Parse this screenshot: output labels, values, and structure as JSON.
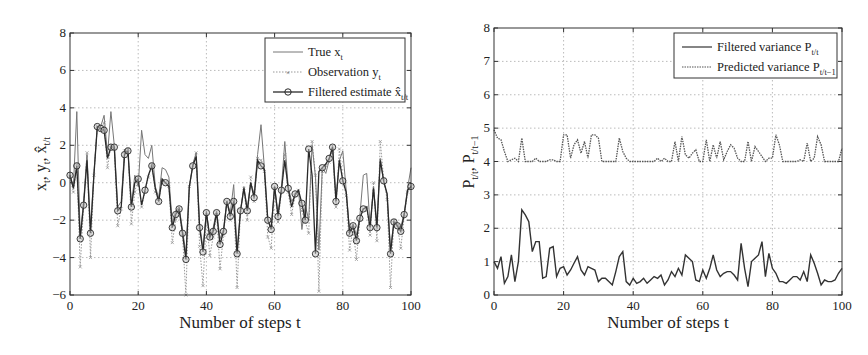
{
  "chart_data": [
    {
      "type": "line",
      "title": "",
      "xlabel": "Number of steps t",
      "ylabel": "x_t, y_t, x̂_t/t",
      "xlim": [
        0,
        100
      ],
      "ylim": [
        -6,
        8
      ],
      "xticks": [
        0,
        20,
        40,
        60,
        80,
        100
      ],
      "yticks": [
        -6,
        -4,
        -2,
        0,
        2,
        4,
        6,
        8
      ],
      "grid": true,
      "legend_position": "upper right",
      "x": [
        0,
        1,
        2,
        3,
        4,
        5,
        6,
        7,
        8,
        9,
        10,
        11,
        12,
        13,
        14,
        15,
        16,
        17,
        18,
        19,
        20,
        21,
        22,
        23,
        24,
        25,
        26,
        27,
        28,
        29,
        30,
        31,
        32,
        33,
        34,
        35,
        36,
        37,
        38,
        39,
        40,
        41,
        42,
        43,
        44,
        45,
        46,
        47,
        48,
        49,
        50,
        51,
        52,
        53,
        54,
        55,
        56,
        57,
        58,
        59,
        60,
        61,
        62,
        63,
        64,
        65,
        66,
        67,
        68,
        69,
        70,
        71,
        72,
        73,
        74,
        75,
        76,
        77,
        78,
        79,
        80,
        81,
        82,
        83,
        84,
        85,
        86,
        87,
        88,
        89,
        90,
        91,
        92,
        93,
        94,
        95,
        96,
        97,
        98,
        99,
        100
      ],
      "series": [
        {
          "name": "True x_t",
          "style": "solid thin gray",
          "values": [
            0.4,
            -0.2,
            3.8,
            -2.8,
            -1.0,
            1.5,
            -2.5,
            0.5,
            3.0,
            3.0,
            3.6,
            1.5,
            3.8,
            2.0,
            -1.3,
            -1.0,
            1.8,
            1.6,
            -1.2,
            0.4,
            -0.2,
            2.8,
            1.5,
            1.3,
            2.0,
            -0.2,
            -0.8,
            0.8,
            0.7,
            0.3,
            -2.2,
            -1.5,
            -1.3,
            -2.5,
            -3.8,
            -0.3,
            1.0,
            1.6,
            -2.2,
            -3.5,
            -1.5,
            -3.0,
            -2.4,
            -1.5,
            -3.0,
            -2.5,
            -1.0,
            -1.6,
            -0.1,
            -3.6,
            -1.5,
            -0.2,
            -1.4,
            0.0,
            -0.6,
            1.5,
            3.1,
            0.8,
            -1.9,
            -2.4,
            -0.2,
            -1.6,
            -0.3,
            2.2,
            -0.2,
            -1.0,
            -0.7,
            -0.4,
            -2.5,
            -1.2,
            -2.0,
            2.0,
            0.3,
            -3.6,
            0.8,
            0.5,
            1.2,
            2.0,
            -0.8,
            1.2,
            1.7,
            -0.4,
            -2.6,
            -2.2,
            -2.8,
            -1.8,
            0.4,
            0.5,
            -2.3,
            -0.2,
            -2.2,
            1.3,
            0.0,
            -0.6,
            -3.5,
            -2.1,
            -2.2,
            -2.4,
            -1.6,
            -0.3,
            0.8
          ]
        },
        {
          "name": "Observation y_t",
          "style": "dotted gray with x markers",
          "values": [
            0.3,
            -0.5,
            1.0,
            -4.5,
            -1.2,
            1.6,
            -4.0,
            0.4,
            3.0,
            2.8,
            3.2,
            0.8,
            2.0,
            1.8,
            -2.3,
            -1.4,
            1.7,
            1.8,
            -2.2,
            -0.5,
            0.3,
            -1.3,
            -0.5,
            0.3,
            1.0,
            -0.5,
            -1.0,
            0.1,
            0.0,
            -0.2,
            -3.2,
            -2.0,
            -1.5,
            -2.8,
            -6.0,
            -0.2,
            0.9,
            1.6,
            -3.4,
            -5.5,
            -1.8,
            -3.9,
            -2.9,
            -1.7,
            -4.6,
            -2.8,
            -1.0,
            -2.0,
            -0.9,
            -5.6,
            -1.5,
            -0.3,
            -2.0,
            0.3,
            -1.0,
            1.3,
            1.2,
            0.6,
            -2.9,
            -3.5,
            -0.3,
            -2.1,
            -0.5,
            1.5,
            -0.5,
            -1.7,
            -0.7,
            -0.4,
            -1.5,
            -2.1,
            -2.7,
            2.2,
            0.4,
            -5.8,
            0.6,
            0.9,
            1.1,
            1.7,
            -1.3,
            1.8,
            0.1,
            -0.7,
            -3.6,
            -2.4,
            -4.1,
            -2.0,
            -1.4,
            -1.3,
            -2.8,
            0.0,
            -3.1,
            2.2,
            0.2,
            -0.9,
            -5.6,
            -2.0,
            -2.3,
            -3.5,
            -1.8,
            -0.5,
            -0.2
          ]
        },
        {
          "name": "Filtered estimate x̂_t/t",
          "style": "solid dark with circle markers",
          "values": [
            0.4,
            -0.3,
            0.9,
            -3.0,
            -1.2,
            1.2,
            -2.7,
            0.4,
            3.0,
            2.9,
            2.8,
            1.3,
            1.9,
            1.9,
            -1.5,
            -1.3,
            1.5,
            1.7,
            -1.3,
            0.0,
            0.2,
            -1.2,
            -0.4,
            0.4,
            0.9,
            -0.3,
            -1.0,
            0.2,
            0.0,
            -0.2,
            -2.4,
            -1.7,
            -1.4,
            -2.7,
            -4.1,
            -0.2,
            0.9,
            1.4,
            -2.4,
            -3.7,
            -1.6,
            -2.9,
            -2.6,
            -1.6,
            -3.3,
            -2.6,
            -1.0,
            -1.8,
            -1.0,
            -3.8,
            -1.5,
            -0.3,
            -1.5,
            0.0,
            -0.8,
            1.2,
            0.9,
            0.7,
            -2.0,
            -2.5,
            -0.2,
            -1.8,
            -0.4,
            1.2,
            -0.3,
            -1.3,
            -0.6,
            -0.4,
            -1.1,
            -2.0,
            1.8,
            0.4,
            -3.8,
            0.6,
            0.8,
            1.0,
            1.3,
            1.9,
            -1.0,
            1.2,
            0.1,
            -0.5,
            -2.7,
            -2.3,
            -3.1,
            -1.9,
            -1.4,
            -1.3,
            -2.4,
            -0.3,
            -2.4,
            1.2,
            0.1,
            -0.6,
            -3.8,
            -2.1,
            -2.3,
            -2.6,
            -1.7,
            -0.4,
            -0.2
          ]
        }
      ]
    },
    {
      "type": "line",
      "title": "",
      "xlabel": "Number of steps t",
      "ylabel": "P_t/t, P_t/t−1",
      "xlim": [
        0,
        100
      ],
      "ylim": [
        0,
        8
      ],
      "xticks": [
        0,
        20,
        40,
        60,
        80,
        100
      ],
      "yticks": [
        0,
        1,
        2,
        3,
        4,
        5,
        6,
        7,
        8
      ],
      "grid": true,
      "legend_position": "upper right",
      "x": [
        0,
        1,
        2,
        3,
        4,
        5,
        6,
        7,
        8,
        9,
        10,
        11,
        12,
        13,
        14,
        15,
        16,
        17,
        18,
        19,
        20,
        21,
        22,
        23,
        24,
        25,
        26,
        27,
        28,
        29,
        30,
        31,
        32,
        33,
        34,
        35,
        36,
        37,
        38,
        39,
        40,
        41,
        42,
        43,
        44,
        45,
        46,
        47,
        48,
        49,
        50,
        51,
        52,
        53,
        54,
        55,
        56,
        57,
        58,
        59,
        60,
        61,
        62,
        63,
        64,
        65,
        66,
        67,
        68,
        69,
        70,
        71,
        72,
        73,
        74,
        75,
        76,
        77,
        78,
        79,
        80,
        81,
        82,
        83,
        84,
        85,
        86,
        87,
        88,
        89,
        90,
        91,
        92,
        93,
        94,
        95,
        96,
        97,
        98,
        99,
        100
      ],
      "series": [
        {
          "name": "Filtered variance P_t/t",
          "style": "solid dark",
          "values": [
            1.0,
            0.8,
            1.15,
            0.35,
            0.55,
            1.2,
            0.4,
            1.0,
            2.55,
            2.4,
            2.2,
            1.3,
            1.6,
            1.6,
            0.5,
            0.55,
            1.4,
            1.45,
            0.55,
            0.8,
            0.85,
            0.6,
            0.75,
            0.95,
            1.15,
            0.75,
            0.6,
            0.85,
            0.8,
            0.75,
            0.4,
            0.5,
            0.5,
            0.4,
            0.3,
            0.7,
            1.15,
            1.3,
            0.4,
            0.3,
            0.5,
            0.35,
            0.4,
            0.5,
            0.35,
            0.45,
            0.55,
            0.5,
            0.6,
            0.3,
            0.45,
            0.7,
            0.55,
            0.8,
            0.6,
            1.2,
            1.1,
            1.0,
            0.45,
            0.4,
            0.75,
            0.5,
            0.8,
            1.2,
            0.75,
            0.55,
            0.65,
            0.7,
            0.7,
            0.6,
            0.45,
            1.55,
            0.8,
            0.25,
            1.0,
            1.1,
            1.2,
            1.6,
            0.55,
            1.25,
            0.8,
            0.65,
            0.4,
            0.4,
            0.35,
            0.45,
            0.55,
            0.55,
            0.45,
            0.7,
            0.4,
            1.2,
            0.95,
            0.65,
            0.3,
            0.45,
            0.4,
            0.4,
            0.45,
            0.65,
            0.8
          ]
        },
        {
          "name": "Predicted variance P_t/t−1",
          "style": "dotted gray",
          "values": [
            4.95,
            4.7,
            4.65,
            4.3,
            4.0,
            4.05,
            4.1,
            4.0,
            4.7,
            4.0,
            4.0,
            4.0,
            4.1,
            4.0,
            4.0,
            4.0,
            4.05,
            4.05,
            4.0,
            4.0,
            4.8,
            4.8,
            4.1,
            4.5,
            4.65,
            4.25,
            4.6,
            4.1,
            4.8,
            4.8,
            4.7,
            4.0,
            4.0,
            4.0,
            4.0,
            4.0,
            4.7,
            4.3,
            4.1,
            4.0,
            4.0,
            4.0,
            4.0,
            4.0,
            4.0,
            4.0,
            4.0,
            4.1,
            4.0,
            4.1,
            4.0,
            4.0,
            4.6,
            4.0,
            4.75,
            4.2,
            4.1,
            4.25,
            4.35,
            4.0,
            4.0,
            4.65,
            4.0,
            4.5,
            4.1,
            4.6,
            4.05,
            4.3,
            4.5,
            4.4,
            4.1,
            4.0,
            4.0,
            4.6,
            4.0,
            4.45,
            4.3,
            4.15,
            4.0,
            4.1,
            4.1,
            4.8,
            4.5,
            4.0,
            4.0,
            4.0,
            4.0,
            4.0,
            4.05,
            4.0,
            4.55,
            4.0,
            4.1,
            4.75,
            4.5,
            4.0,
            4.0,
            4.0,
            4.0,
            4.0,
            4.4
          ]
        }
      ]
    }
  ],
  "figures": {
    "left": {
      "ylabel_parts": [
        "x",
        "t",
        ", y",
        "t",
        ", x̂",
        "t/t"
      ],
      "xlabel": "Number of steps t",
      "legend": [
        {
          "main": "True x",
          "sub": "t"
        },
        {
          "main": "Observation y",
          "sub": "t"
        },
        {
          "main": "Filtered estimate x̂",
          "sub": "t/t"
        }
      ]
    },
    "right": {
      "xlabel": "Number of steps t",
      "legend": [
        {
          "main": "Filtered variance P",
          "sub": "t/t"
        },
        {
          "main": "Predicted variance P",
          "sub": "t/t−1"
        }
      ]
    }
  },
  "colors": {
    "axis": "#333333",
    "grid": "#bbbbbb",
    "true_line": "#777777",
    "obs_line": "#999999",
    "est_line": "#2a2a2a",
    "filt_var": "#333333",
    "pred_var": "#555555"
  }
}
